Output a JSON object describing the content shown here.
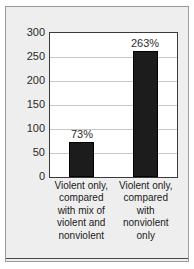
{
  "chart_data": {
    "type": "bar",
    "title": "",
    "subtitle": "",
    "xlabel": "",
    "ylabel": "",
    "categories": [
      "Violent only, compared with mix of violent and nonviolent",
      "Violent only, compared with nonviolent only"
    ],
    "values": [
      73,
      263
    ],
    "data_labels": [
      "73%",
      "263%"
    ],
    "ylim": [
      0,
      300
    ],
    "yticks": [
      0,
      50,
      100,
      150,
      200,
      250,
      300
    ],
    "ytick_labels": [
      "0",
      "50",
      "100",
      "150",
      "200",
      "250",
      "300"
    ],
    "grid": true,
    "grid_axis": "y",
    "legend": false,
    "legend_position": "none",
    "bar_color": "#1c1c1c",
    "plot_background": "#ffffff",
    "figure_background": "#eeeeee",
    "gridline_color": "#c9c9c9",
    "axis_color": "#3a3a3a",
    "text_color": "#1a1a1a"
  }
}
